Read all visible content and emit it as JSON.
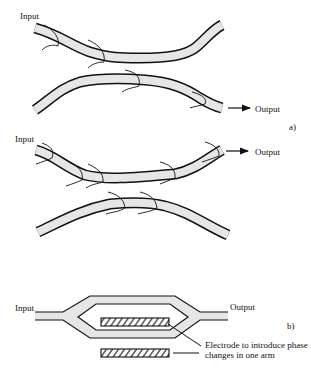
{
  "figure_a": {
    "panel_label": "a)",
    "top": {
      "input_label": "Input",
      "output_label": "Output"
    },
    "bottom": {
      "input_label": "Input",
      "output_label": "Output"
    }
  },
  "figure_b": {
    "panel_label": "b)",
    "input_label": "Input",
    "output_label": "Output",
    "electrode_note": "Electrode to introduce phase changes in one arm"
  },
  "colors": {
    "fiber_fill": "#e6e6e6",
    "stroke": "#111111"
  }
}
